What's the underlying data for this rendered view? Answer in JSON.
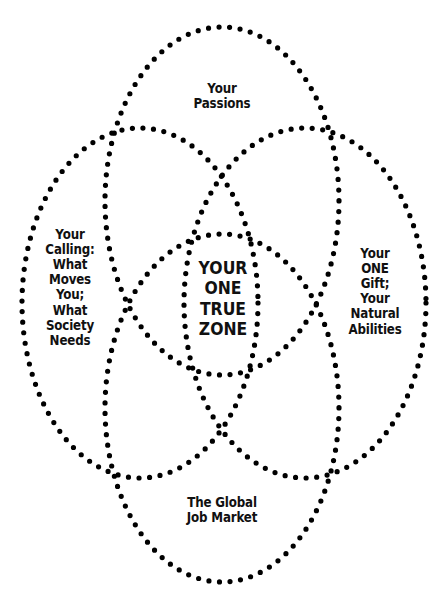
{
  "diagram": {
    "type": "venn",
    "sets": [
      {
        "id": "passions",
        "label": "Your\nPassions"
      },
      {
        "id": "calling",
        "label": "Your\nCalling:\nWhat\nMoves\nYou;\nWhat\nSociety\nNeeds"
      },
      {
        "id": "gift",
        "label": "Your\nONE\nGift;\nYour\nNatural\nAbilities"
      },
      {
        "id": "market",
        "label": "The Global\nJob Market"
      }
    ],
    "intersection": {
      "label": "YOUR\nONE\nTRUE\nZONE"
    }
  },
  "colors": {
    "stroke": "#000000",
    "background": "#ffffff",
    "text": "#111111"
  }
}
